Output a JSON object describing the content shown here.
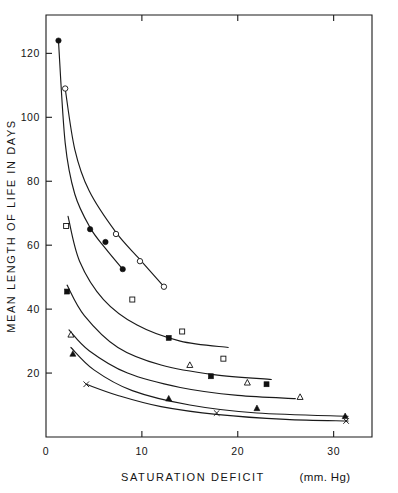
{
  "chart_data": {
    "type": "scatter",
    "title": "",
    "xlabel": "SATURATION  DEFICIT",
    "xunit": "(mm. Hg)",
    "ylabel": "MEAN  LENGTH  OF  LIFE  IN  DAYS",
    "xlim": [
      0,
      34
    ],
    "ylim": [
      0,
      132
    ],
    "xticks": [
      0,
      10,
      20,
      30
    ],
    "xticklabels": [
      "0",
      "10",
      "20",
      "30"
    ],
    "yticks": [
      20,
      40,
      60,
      80,
      100,
      120
    ],
    "yticklabels": [
      "20",
      "40",
      "60",
      "80",
      "100",
      "120"
    ],
    "grid": false,
    "legend": "none",
    "series": [
      {
        "name": "series-1-filled-circle",
        "marker": "filled-circle",
        "points": [
          {
            "x": 1.3,
            "y": 124.0
          },
          {
            "x": 4.6,
            "y": 65.0
          },
          {
            "x": 6.2,
            "y": 61.0
          },
          {
            "x": 8.0,
            "y": 52.5
          }
        ],
        "curve": [
          {
            "x": 1.3,
            "y": 124.0
          },
          {
            "x": 2.0,
            "y": 92.0
          },
          {
            "x": 3.0,
            "y": 76.0
          },
          {
            "x": 4.6,
            "y": 65.5
          },
          {
            "x": 6.2,
            "y": 59.0
          },
          {
            "x": 8.0,
            "y": 52.5
          }
        ]
      },
      {
        "name": "series-2-open-circle",
        "marker": "open-circle",
        "points": [
          {
            "x": 2.0,
            "y": 109.0
          },
          {
            "x": 7.3,
            "y": 63.5
          },
          {
            "x": 9.8,
            "y": 55.0
          },
          {
            "x": 12.3,
            "y": 47.0
          }
        ],
        "curve": [
          {
            "x": 2.0,
            "y": 109.0
          },
          {
            "x": 3.0,
            "y": 90.0
          },
          {
            "x": 4.5,
            "y": 77.0
          },
          {
            "x": 7.3,
            "y": 64.0
          },
          {
            "x": 9.8,
            "y": 55.5
          },
          {
            "x": 12.3,
            "y": 47.0
          }
        ]
      },
      {
        "name": "series-3-open-square",
        "marker": "open-square",
        "points": [
          {
            "x": 2.1,
            "y": 66.0
          },
          {
            "x": 9.0,
            "y": 43.0
          },
          {
            "x": 14.2,
            "y": 33.0
          },
          {
            "x": 18.5,
            "y": 24.5
          }
        ],
        "curve": [
          {
            "x": 2.3,
            "y": 69.0
          },
          {
            "x": 3.5,
            "y": 55.0
          },
          {
            "x": 6.0,
            "y": 43.0
          },
          {
            "x": 9.5,
            "y": 35.0
          },
          {
            "x": 14.0,
            "y": 30.0
          },
          {
            "x": 19.0,
            "y": 28.0
          }
        ]
      },
      {
        "name": "series-4-filled-square",
        "marker": "filled-square",
        "points": [
          {
            "x": 2.2,
            "y": 45.5
          },
          {
            "x": 12.8,
            "y": 31.0
          },
          {
            "x": 17.2,
            "y": 19.0
          },
          {
            "x": 23.0,
            "y": 16.5
          }
        ],
        "curve": [
          {
            "x": 2.2,
            "y": 47.5
          },
          {
            "x": 4.0,
            "y": 38.0
          },
          {
            "x": 7.5,
            "y": 28.0
          },
          {
            "x": 12.0,
            "y": 22.5
          },
          {
            "x": 17.5,
            "y": 19.5
          },
          {
            "x": 23.5,
            "y": 18.0
          }
        ]
      },
      {
        "name": "series-5-open-triangle",
        "marker": "open-triangle",
        "points": [
          {
            "x": 2.6,
            "y": 32.0
          },
          {
            "x": 15.0,
            "y": 22.5
          },
          {
            "x": 21.0,
            "y": 17.0
          },
          {
            "x": 26.5,
            "y": 12.5
          }
        ],
        "curve": [
          {
            "x": 2.4,
            "y": 33.5
          },
          {
            "x": 4.5,
            "y": 27.0
          },
          {
            "x": 8.5,
            "y": 20.0
          },
          {
            "x": 14.0,
            "y": 15.5
          },
          {
            "x": 20.0,
            "y": 13.0
          },
          {
            "x": 26.0,
            "y": 12.0
          }
        ]
      },
      {
        "name": "series-6-filled-triangle",
        "marker": "filled-triangle",
        "points": [
          {
            "x": 2.8,
            "y": 26.0
          },
          {
            "x": 12.8,
            "y": 12.0
          },
          {
            "x": 22.0,
            "y": 9.0
          },
          {
            "x": 31.2,
            "y": 6.5
          }
        ],
        "curve": [
          {
            "x": 2.6,
            "y": 28.0
          },
          {
            "x": 5.0,
            "y": 21.0
          },
          {
            "x": 9.0,
            "y": 14.5
          },
          {
            "x": 15.0,
            "y": 10.0
          },
          {
            "x": 22.0,
            "y": 7.5
          },
          {
            "x": 31.5,
            "y": 6.5
          }
        ]
      },
      {
        "name": "series-7-cross",
        "marker": "cross",
        "points": [
          {
            "x": 4.2,
            "y": 16.5
          },
          {
            "x": 17.8,
            "y": 7.5
          },
          {
            "x": 31.3,
            "y": 5.0
          }
        ],
        "curve": [
          {
            "x": 4.2,
            "y": 16.5
          },
          {
            "x": 7.5,
            "y": 13.0
          },
          {
            "x": 12.0,
            "y": 9.5
          },
          {
            "x": 18.0,
            "y": 7.0
          },
          {
            "x": 25.0,
            "y": 5.5
          },
          {
            "x": 31.5,
            "y": 5.0
          }
        ]
      }
    ]
  }
}
